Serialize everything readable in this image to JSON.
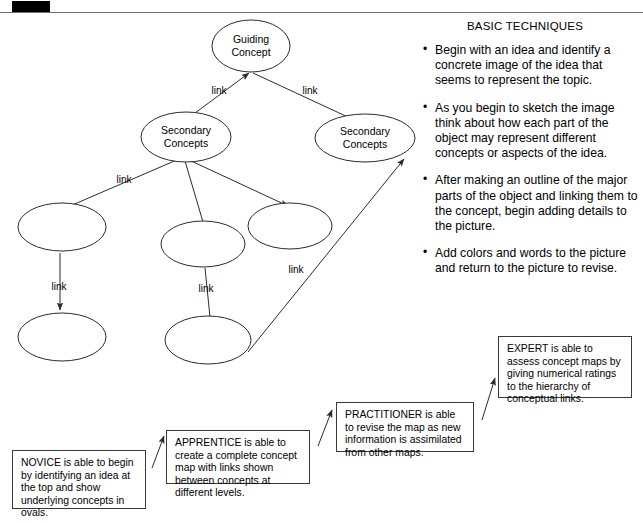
{
  "page": {
    "registration_mark": "black-bar",
    "background_color": "#ffffff",
    "rule_color": "#6f6f6f"
  },
  "diagram": {
    "nodes": [
      {
        "id": "guiding",
        "label_line1": "Guiding",
        "label_line2": "Concept",
        "cx": 251,
        "cy": 46,
        "rx": 39,
        "ry": 26
      },
      {
        "id": "secondary_l",
        "label_line1": "Secondary",
        "label_line2": "Concepts",
        "cx": 186,
        "cy": 137,
        "rx": 45,
        "ry": 25
      },
      {
        "id": "secondary_r",
        "label_line1": "Secondary",
        "label_line2": "Concepts",
        "cx": 365,
        "cy": 138,
        "rx": 50,
        "ry": 24
      },
      {
        "id": "oval_a",
        "label_line1": "",
        "label_line2": "",
        "cx": 62,
        "cy": 227,
        "rx": 44,
        "ry": 24
      },
      {
        "id": "oval_b",
        "label_line1": "",
        "label_line2": "",
        "cx": 62,
        "cy": 337,
        "rx": 44,
        "ry": 24
      },
      {
        "id": "oval_c",
        "label_line1": "",
        "label_line2": "",
        "cx": 203,
        "cy": 244,
        "rx": 42,
        "ry": 23
      },
      {
        "id": "oval_d",
        "label_line1": "",
        "label_line2": "",
        "cx": 290,
        "cy": 226,
        "rx": 42,
        "ry": 23
      },
      {
        "id": "oval_e",
        "label_line1": "",
        "label_line2": "",
        "cx": 208,
        "cy": 340,
        "rx": 43,
        "ry": 24
      }
    ],
    "link_labels": [
      {
        "text": "link",
        "x": 219,
        "y": 94
      },
      {
        "text": "link",
        "x": 310,
        "y": 94
      },
      {
        "text": "link",
        "x": 124,
        "y": 183
      },
      {
        "text": "link",
        "x": 59,
        "y": 290
      },
      {
        "text": "link",
        "x": 206,
        "y": 292
      },
      {
        "text": "link",
        "x": 296,
        "y": 273
      }
    ]
  },
  "techniques": {
    "title": "BASIC TECHNIQUES",
    "bullets": [
      "Begin with an idea and identify a concrete image of the idea that seems to represent the topic.",
      "As you begin to sketch the image think about how each part of the object may represent different concepts or aspects of the idea.",
      "After making an outline of the major parts of the object and linking them to the concept, begin adding details to the picture.",
      "Add colors and words to the picture and return to the picture to revise."
    ]
  },
  "levels": {
    "novice": "NOVICE is able to begin by identifying an idea at the top and show underlying concepts in ovals.",
    "apprentice": "APPRENTICE is able to create a complete concept map with links shown between concepts at different levels.",
    "practitioner": "PRACTITIONER is able to revise the map as new information is assimilated from other maps.",
    "expert": "EXPERT is able to assess concept maps by giving numerical ratings to the hierarchy of conceptual links."
  }
}
